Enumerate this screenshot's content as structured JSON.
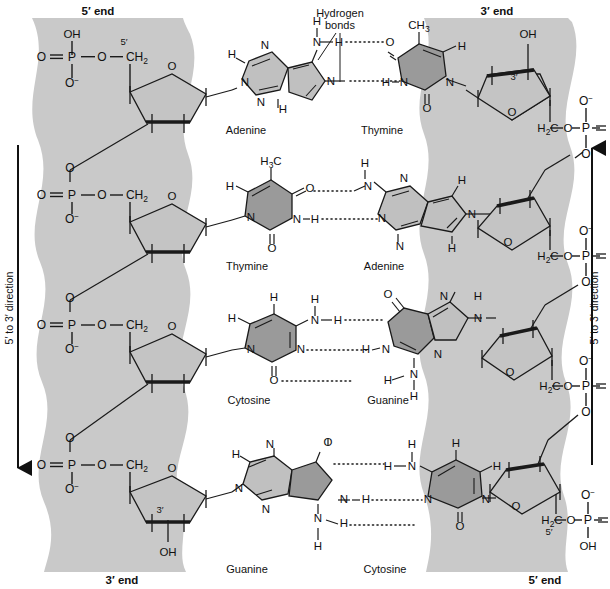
{
  "figure": {
    "type": "dna-double-helix-chemical-structure",
    "background_color": "#ffffff",
    "backbone_band_color": "#c9c9c9",
    "purine_fill": "#c0c0c0",
    "pyrimidine_fill": "#9a9a9a",
    "sugar_fill": "#c4c4c4",
    "line_color": "#1a1a1a"
  },
  "end_labels": {
    "top_left": "5′ end",
    "top_right": "3′ end",
    "bottom_left": "3′ end",
    "bottom_right": "5′ end"
  },
  "direction_labels": {
    "left": "5′ to 3′ direction",
    "right": "5′ to 3′ direction",
    "left_arrow": "down",
    "right_arrow": "up"
  },
  "callout": {
    "line1": "Hydrogen",
    "line2": "bonds"
  },
  "base_pairs": [
    {
      "left_base": "Adenine",
      "right_base": "Thymine",
      "hbonds": 2
    },
    {
      "left_base": "Thymine",
      "right_base": "Adenine",
      "hbonds": 2
    },
    {
      "left_base": "Cytosine",
      "right_base": "Guanine",
      "hbonds": 3
    },
    {
      "left_base": "Guanine",
      "right_base": "Cytosine",
      "hbonds": 3
    }
  ],
  "atoms": {
    "phosphorus": "P",
    "oxygen": "O",
    "nitrogen": "N",
    "hydrogen": "H",
    "carbon": "C",
    "hydroxyl": "OH",
    "oxygen_anion": "O",
    "methylene": "H",
    "methylene_sub": "2",
    "methylene_c": "C",
    "methyl": "CH",
    "methyl_sub": "3",
    "ch2_label": "CH",
    "ch2_sub": "2",
    "h2c_label": "H",
    "h2c_sub": "2",
    "h2c_c": "C",
    "minus": "−"
  },
  "carbon_markers": {
    "five_prime": "5′",
    "three_prime": "3′"
  }
}
